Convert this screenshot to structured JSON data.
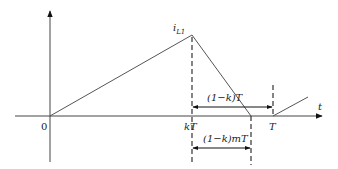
{
  "diagram": {
    "type": "current waveform timing diagram",
    "colors": {
      "line": "#555555",
      "axis": "#444444",
      "arrow": "#111111",
      "background": "#ffffff"
    },
    "axes": {
      "x_label": "t",
      "origin_label": "0"
    },
    "peak_label": {
      "main": "i",
      "sub": "L1"
    },
    "tick_labels": {
      "kT": "kT",
      "T": "T"
    },
    "dimensions": {
      "upper": "(1−k)T",
      "lower": "(1−k)mT"
    },
    "waveform_points": [
      {
        "x": "0",
        "y": 0
      },
      {
        "x": "kT",
        "y": "i_L1"
      },
      {
        "x": "kT + (1-k)mT",
        "y": 0
      },
      {
        "x": "T",
        "y": 0
      }
    ]
  }
}
